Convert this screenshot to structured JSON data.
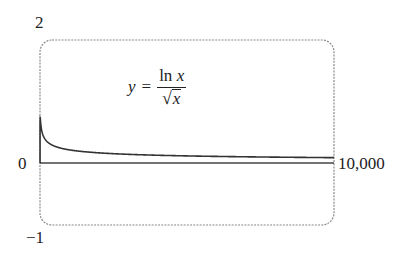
{
  "chart_data": {
    "type": "line",
    "title": "",
    "annotation": "y = ln x / √x",
    "function": "ln(x)/sqrt(x)",
    "xlabel": "",
    "ylabel": "",
    "xlim": [
      0,
      10000
    ],
    "ylim": [
      -1,
      2
    ],
    "x_tick_labels": [
      "0",
      "10,000"
    ],
    "y_tick_labels": [
      "2",
      "-1"
    ],
    "grid": false,
    "legend": null,
    "series": [
      {
        "name": "y = ln x / √x",
        "x": [
          1,
          2,
          5,
          7.4,
          20,
          50,
          100,
          250,
          500,
          1000,
          2000,
          3000,
          5000,
          7500,
          10000
        ],
        "values": [
          0,
          0.49,
          0.72,
          0.74,
          0.67,
          0.55,
          0.46,
          0.35,
          0.28,
          0.22,
          0.17,
          0.146,
          0.12,
          0.103,
          0.092
        ]
      }
    ]
  },
  "labels": {
    "y_top": "2",
    "y_bottom": "−1",
    "x_left": "0",
    "x_right": "10,000",
    "formula_lhs": "y",
    "formula_eq": "=",
    "formula_num_fn": "ln",
    "formula_num_var": "x",
    "formula_den_sqrt": "√",
    "formula_den_var": "x"
  },
  "colors": {
    "frame": "#8a8a8a",
    "curve": "#333333",
    "axis": "#444444",
    "text": "#222222"
  }
}
